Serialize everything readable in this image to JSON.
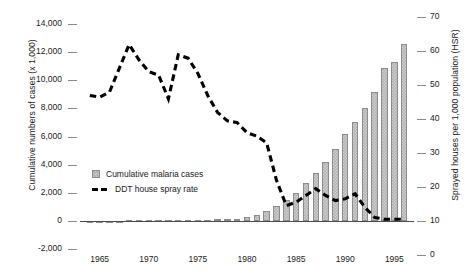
{
  "chart_data": {
    "type": "bar",
    "title": "",
    "xlabel": "",
    "ylabel": "Cumulative numbers of cases (x 1,000)",
    "y2label": "Sprayed houses per 1,000 population (HSR)",
    "xlim": [
      1963,
      1997
    ],
    "ylim": [
      -2000,
      14000
    ],
    "y2lim": [
      0,
      70
    ],
    "grid": false,
    "legend_position": "inside-left",
    "x_ticks": [
      "1965",
      "1970",
      "1975",
      "1980",
      "1985",
      "1990",
      "1995"
    ],
    "x_tick_values": [
      1965,
      1970,
      1975,
      1980,
      1985,
      1990,
      1995
    ],
    "y_ticks": [
      "14,000",
      "12,000",
      "10,000",
      "8,000",
      "6,000",
      "4,000",
      "2,000",
      "0",
      "-2,000"
    ],
    "y_tick_values": [
      14000,
      12000,
      10000,
      8000,
      6000,
      4000,
      2000,
      0,
      -2000
    ],
    "y2_ticks": [
      "70",
      "60",
      "50",
      "40",
      "30",
      "20",
      "10",
      "0"
    ],
    "y2_tick_values": [
      70,
      60,
      50,
      40,
      30,
      20,
      10,
      0
    ],
    "x": [
      1964,
      1965,
      1966,
      1967,
      1968,
      1969,
      1970,
      1971,
      1972,
      1973,
      1974,
      1975,
      1976,
      1977,
      1978,
      1979,
      1980,
      1981,
      1982,
      1983,
      1984,
      1985,
      1986,
      1987,
      1988,
      1989,
      1990,
      1991,
      1992,
      1993,
      1994,
      1995,
      1996
    ],
    "series": [
      {
        "name": "Cumulative malaria cases",
        "type": "bar",
        "axis": "left",
        "unit": "cases x 1,000",
        "color": "#b4b4b4",
        "values": [
          10,
          15,
          20,
          25,
          30,
          35,
          40,
          45,
          50,
          60,
          70,
          80,
          90,
          100,
          110,
          120,
          260,
          420,
          700,
          1080,
          1500,
          2000,
          2700,
          3400,
          4200,
          5100,
          6200,
          7000,
          8000,
          9200,
          10900,
          11300,
          12600
        ]
      },
      {
        "name": "DDT house spray rate",
        "type": "line",
        "axis": "right",
        "unit": "sprayed houses per 1,000 population",
        "color": "#000000",
        "dashed": true,
        "values": [
          47,
          46.5,
          48,
          55,
          62,
          57.5,
          54,
          53,
          46,
          59,
          58,
          53.5,
          47,
          42,
          39.5,
          39,
          36,
          35,
          33,
          22,
          14.5,
          15.5,
          17.5,
          19.5,
          17.5,
          16,
          16.5,
          18,
          14,
          11,
          10.5,
          10.5,
          10.5
        ]
      }
    ]
  },
  "legend": {
    "items": [
      {
        "label": "Cumulative malaria cases",
        "marker": "bar-swatch"
      },
      {
        "label": "DDT house spray rate",
        "marker": "dashed-line-swatch"
      }
    ]
  }
}
